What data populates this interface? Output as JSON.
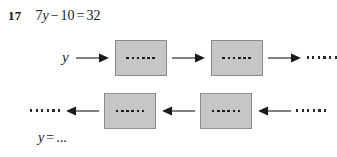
{
  "exercise": {
    "number": "17",
    "equation": {
      "full": "7y − 10 = 32",
      "coefficient": "7",
      "variable": "y",
      "minus": "−",
      "constant": "10",
      "equals": "=",
      "result": "32"
    },
    "answer_prompt": {
      "variable": "y",
      "equals": "=",
      "blank": "..."
    }
  },
  "diagram": {
    "type": "function-machine-flowchart",
    "box_fill_color": "#c6c6c6",
    "box_border_color": "#8c8c8c",
    "arrow_color": "#1a1a1a",
    "dots_per_box": 6,
    "dots_per_loose_ellipsis": 6,
    "forward_row": {
      "start_label": "y",
      "boxes": [
        {
          "id": "forward-box-1",
          "content": "......"
        },
        {
          "id": "forward-box-2",
          "content": "......"
        }
      ],
      "end_label": "......",
      "arrow_direction": "right",
      "arrow_count": 3
    },
    "backward_row": {
      "start_label": "......",
      "boxes": [
        {
          "id": "backward-box-1",
          "content": "......"
        },
        {
          "id": "backward-box-2",
          "content": "......"
        }
      ],
      "end_label": "......",
      "arrow_direction": "left",
      "arrow_count": 3
    }
  }
}
